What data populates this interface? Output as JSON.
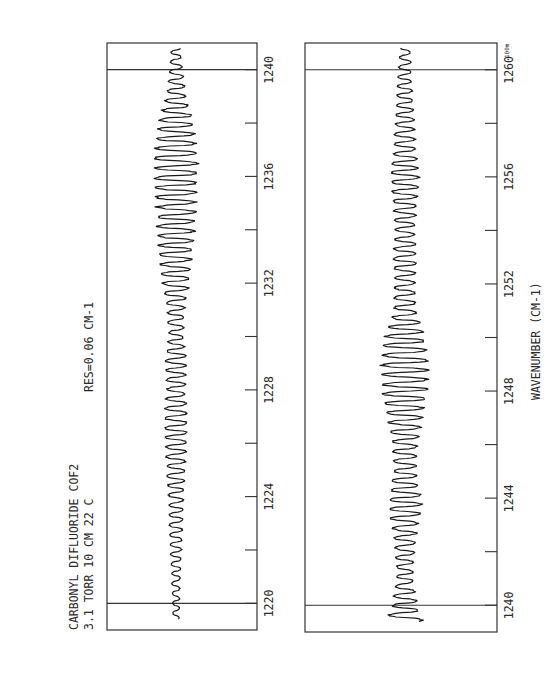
{
  "chart_data": [
    {
      "type": "line",
      "title": "CARBONYL DIFLUORIDE COF2",
      "subtitle": "3.1 TORR  10 CM  22 C",
      "annotation": "RES=0.06 CM-1",
      "xlabel": "",
      "ylabel": "",
      "xlim": [
        1219,
        1241
      ],
      "x_ticks": [
        1220,
        1222,
        1224,
        1226,
        1228,
        1230,
        1232,
        1234,
        1236,
        1238,
        1240
      ],
      "x_tick_labels": [
        "1220",
        "1224",
        "1228",
        "1232",
        "1236",
        "1240"
      ],
      "x_tick_label_values": [
        1220,
        1224,
        1228,
        1232,
        1236,
        1240
      ],
      "grid": false,
      "reference_lines_x": [
        1220,
        1240
      ],
      "orientation": "rotated-90",
      "series": [
        {
          "name": "transmittance",
          "envelope": [
            {
              "x": 1219.5,
              "amp": 0.05
            },
            {
              "x": 1221,
              "amp": 0.07
            },
            {
              "x": 1222,
              "amp": 0.09
            },
            {
              "x": 1223,
              "amp": 0.11
            },
            {
              "x": 1224,
              "amp": 0.12
            },
            {
              "x": 1225,
              "amp": 0.15
            },
            {
              "x": 1226,
              "amp": 0.17
            },
            {
              "x": 1227,
              "amp": 0.19
            },
            {
              "x": 1228,
              "amp": 0.15
            },
            {
              "x": 1229,
              "amp": 0.17
            },
            {
              "x": 1230,
              "amp": 0.12
            },
            {
              "x": 1231,
              "amp": 0.14
            },
            {
              "x": 1232,
              "amp": 0.22
            },
            {
              "x": 1233,
              "amp": 0.26
            },
            {
              "x": 1234,
              "amp": 0.3
            },
            {
              "x": 1235,
              "amp": 0.32
            },
            {
              "x": 1236,
              "amp": 0.36
            },
            {
              "x": 1237,
              "amp": 0.34
            },
            {
              "x": 1238,
              "amp": 0.28
            },
            {
              "x": 1239,
              "amp": 0.16
            },
            {
              "x": 1240,
              "amp": 0.1
            },
            {
              "x": 1241,
              "amp": 0.07
            }
          ],
          "center": 0.46,
          "line_spacing_cm1": 0.36
        }
      ]
    },
    {
      "type": "line",
      "xlabel": "WAVENUMBER (CM-1)",
      "ylabel": "",
      "xlim": [
        1239,
        1261
      ],
      "x_ticks": [
        1240,
        1242,
        1244,
        1246,
        1248,
        1250,
        1252,
        1254,
        1256,
        1258,
        1260
      ],
      "x_tick_labels": [
        "1240",
        "1244",
        "1248",
        "1252",
        "1256",
        "1260"
      ],
      "x_tick_label_values": [
        1240,
        1244,
        1248,
        1252,
        1256,
        1260
      ],
      "grid": false,
      "reference_lines_x": [
        1240,
        1260
      ],
      "orientation": "rotated-90",
      "scale_label": "100m",
      "series": [
        {
          "name": "transmittance",
          "envelope": [
            {
              "x": 1239.3,
              "amp": 0.24
            },
            {
              "x": 1240,
              "amp": 0.16
            },
            {
              "x": 1241,
              "amp": 0.1
            },
            {
              "x": 1242,
              "amp": 0.12
            },
            {
              "x": 1243,
              "amp": 0.16
            },
            {
              "x": 1243.8,
              "amp": 0.22
            },
            {
              "x": 1245,
              "amp": 0.14
            },
            {
              "x": 1246,
              "amp": 0.16
            },
            {
              "x": 1247,
              "amp": 0.22
            },
            {
              "x": 1248,
              "amp": 0.28
            },
            {
              "x": 1249,
              "amp": 0.3
            },
            {
              "x": 1250,
              "amp": 0.25
            },
            {
              "x": 1251,
              "amp": 0.14
            },
            {
              "x": 1252,
              "amp": 0.13
            },
            {
              "x": 1253,
              "amp": 0.15
            },
            {
              "x": 1254,
              "amp": 0.12
            },
            {
              "x": 1255,
              "amp": 0.15
            },
            {
              "x": 1256,
              "amp": 0.18
            },
            {
              "x": 1257,
              "amp": 0.14
            },
            {
              "x": 1258,
              "amp": 0.12
            },
            {
              "x": 1259,
              "amp": 0.1
            },
            {
              "x": 1260,
              "amp": 0.08
            },
            {
              "x": 1261,
              "amp": 0.06
            }
          ],
          "center": 0.52,
          "line_spacing_cm1": 0.36
        }
      ]
    }
  ],
  "labels": {
    "title_line1": "CARBONYL DIFLUORIDE  COF2",
    "title_line2": "3.1 TORR   10 CM  22 C",
    "resolution": "RES=0.06 CM-1",
    "x_axis_title": "WAVENUMBER (CM-1)",
    "scale_mark": "100m"
  }
}
